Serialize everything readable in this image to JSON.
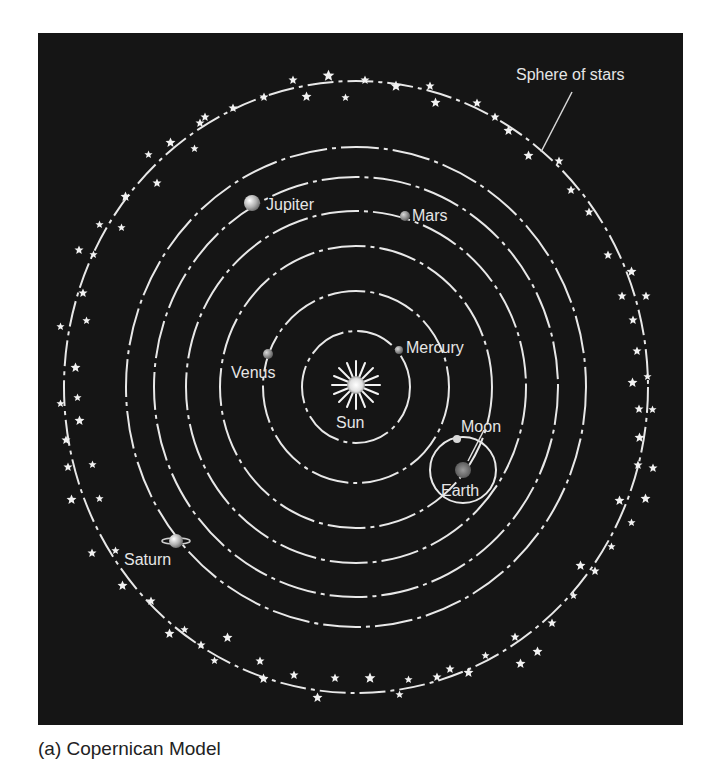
{
  "figure": {
    "caption": "(a) Copernican Model",
    "background_color": "#151515",
    "line_color": "#e8e8e8",
    "center": {
      "x": 356,
      "y": 387
    },
    "orbits": [
      {
        "name": "Mercury",
        "rx": 54,
        "ry": 56
      },
      {
        "name": "Venus",
        "rx": 93,
        "ry": 96
      },
      {
        "name": "Earth",
        "rx": 136,
        "ry": 141
      },
      {
        "name": "Mars",
        "rx": 170,
        "ry": 176
      },
      {
        "name": "Jupiter",
        "rx": 202,
        "ry": 210
      },
      {
        "name": "Saturn",
        "rx": 230,
        "ry": 240
      },
      {
        "name": "Sphere of stars",
        "rx": 292,
        "ry": 306
      }
    ],
    "labels": {
      "sun": "Sun",
      "mercury": "Mercury",
      "venus": "Venus",
      "earth": "Earth",
      "moon": "Moon",
      "mars": "Mars",
      "jupiter": "Jupiter",
      "saturn": "Saturn",
      "sphere_of_stars": "Sphere of stars"
    }
  }
}
